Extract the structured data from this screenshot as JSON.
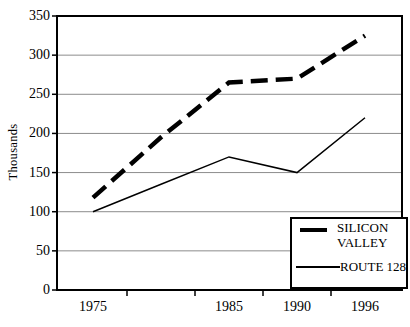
{
  "chart_data": {
    "type": "line",
    "title": "",
    "ylabel": "Thousands",
    "xlabel": "",
    "categories": [
      "1975",
      "1980",
      "1985",
      "1990",
      "1996"
    ],
    "x_axis_labels_shown": [
      "1975",
      "",
      "1985",
      "1990",
      "1996"
    ],
    "ylim": [
      0,
      350
    ],
    "yticks": [
      0,
      50,
      100,
      150,
      200,
      250,
      300,
      350
    ],
    "grid": true,
    "legend_position": "inside-bottom-right",
    "series": [
      {
        "name": "SILICON VALLEY",
        "line_style": "thick-dashed",
        "color": "#000000",
        "values": [
          118,
          195,
          265,
          270,
          325
        ]
      },
      {
        "name": "ROUTE 128",
        "line_style": "thin-solid",
        "color": "#000000",
        "values": [
          100,
          135,
          170,
          150,
          220
        ]
      }
    ],
    "colors": {
      "background": "#ffffff",
      "axis": "#000000",
      "gridline": "#8c8c8c",
      "text": "#000000"
    }
  }
}
